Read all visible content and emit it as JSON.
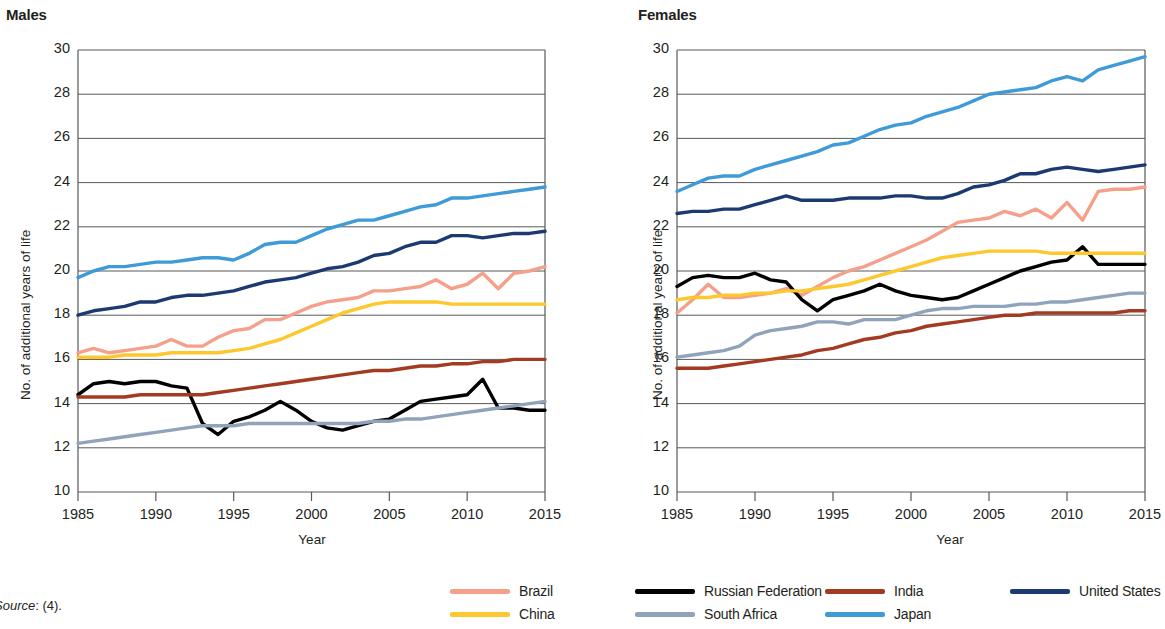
{
  "figure": {
    "source_note_italic": "Source",
    "source_note_rest": ": (4)."
  },
  "legend": {
    "position": "bottom-center",
    "items": [
      {
        "label": "Brazil",
        "color": "#f4a08a"
      },
      {
        "label": "Russian Federation",
        "color": "#000000"
      },
      {
        "label": "India",
        "color": "#a33b22"
      },
      {
        "label": "United States",
        "color": "#1c3a71"
      },
      {
        "label": "China",
        "color": "#fcc82d"
      },
      {
        "label": "South Africa",
        "color": "#8fa4bb"
      },
      {
        "label": "Japan",
        "color": "#3f9ad8"
      }
    ]
  },
  "chart_data": [
    {
      "type": "line",
      "title": "Males",
      "xlabel": "Year",
      "ylabel": "No. of additional years of life",
      "xlim": [
        1985,
        2015
      ],
      "ylim": [
        10,
        30
      ],
      "xticks": [
        1985,
        1990,
        1995,
        2000,
        2005,
        2010,
        2015
      ],
      "yticks": [
        10,
        12,
        14,
        16,
        18,
        20,
        22,
        24,
        26,
        28,
        30
      ],
      "grid": true,
      "x": [
        1985,
        1986,
        1987,
        1988,
        1989,
        1990,
        1991,
        1992,
        1993,
        1994,
        1995,
        1996,
        1997,
        1998,
        1999,
        2000,
        2001,
        2002,
        2003,
        2004,
        2005,
        2006,
        2007,
        2008,
        2009,
        2010,
        2011,
        2012,
        2013,
        2014,
        2015
      ],
      "series": [
        {
          "name": "Brazil",
          "color": "#f4a08a",
          "values": [
            16.3,
            16.5,
            16.3,
            16.4,
            16.5,
            16.6,
            16.9,
            16.6,
            16.6,
            17.0,
            17.3,
            17.4,
            17.8,
            17.8,
            18.1,
            18.4,
            18.6,
            18.7,
            18.8,
            19.1,
            19.1,
            19.2,
            19.3,
            19.6,
            19.2,
            19.4,
            19.9,
            19.2,
            19.9,
            20.0,
            20.2
          ]
        },
        {
          "name": "Russian Federation",
          "color": "#000000",
          "values": [
            14.4,
            14.9,
            15.0,
            14.9,
            15.0,
            15.0,
            14.8,
            14.7,
            13.1,
            12.6,
            13.2,
            13.4,
            13.7,
            14.1,
            13.7,
            13.2,
            12.9,
            12.8,
            13.0,
            13.2,
            13.3,
            13.7,
            14.1,
            14.2,
            14.3,
            14.4,
            15.1,
            13.8,
            13.8,
            13.7,
            13.7
          ]
        },
        {
          "name": "India",
          "color": "#a33b22",
          "values": [
            14.3,
            14.3,
            14.3,
            14.3,
            14.4,
            14.4,
            14.4,
            14.4,
            14.4,
            14.5,
            14.6,
            14.7,
            14.8,
            14.9,
            15.0,
            15.1,
            15.2,
            15.3,
            15.4,
            15.5,
            15.5,
            15.6,
            15.7,
            15.7,
            15.8,
            15.8,
            15.9,
            15.9,
            16.0,
            16.0,
            16.0
          ]
        },
        {
          "name": "United States",
          "color": "#1c3a71",
          "values": [
            18.0,
            18.2,
            18.3,
            18.4,
            18.6,
            18.6,
            18.8,
            18.9,
            18.9,
            19.0,
            19.1,
            19.3,
            19.5,
            19.6,
            19.7,
            19.9,
            20.1,
            20.2,
            20.4,
            20.7,
            20.8,
            21.1,
            21.3,
            21.3,
            21.6,
            21.6,
            21.5,
            21.6,
            21.7,
            21.7,
            21.8
          ]
        },
        {
          "name": "China",
          "color": "#fcc82d",
          "values": [
            16.1,
            16.1,
            16.1,
            16.2,
            16.2,
            16.2,
            16.3,
            16.3,
            16.3,
            16.3,
            16.4,
            16.5,
            16.7,
            16.9,
            17.2,
            17.5,
            17.8,
            18.1,
            18.3,
            18.5,
            18.6,
            18.6,
            18.6,
            18.6,
            18.5,
            18.5,
            18.5,
            18.5,
            18.5,
            18.5,
            18.5
          ]
        },
        {
          "name": "South Africa",
          "color": "#8fa4bb",
          "values": [
            12.2,
            12.3,
            12.4,
            12.5,
            12.6,
            12.7,
            12.8,
            12.9,
            13.0,
            13.0,
            13.0,
            13.1,
            13.1,
            13.1,
            13.1,
            13.1,
            13.1,
            13.1,
            13.1,
            13.2,
            13.2,
            13.3,
            13.3,
            13.4,
            13.5,
            13.6,
            13.7,
            13.8,
            13.9,
            14.0,
            14.1
          ]
        },
        {
          "name": "Japan",
          "color": "#3f9ad8",
          "values": [
            19.7,
            20.0,
            20.2,
            20.2,
            20.3,
            20.4,
            20.4,
            20.5,
            20.6,
            20.6,
            20.5,
            20.8,
            21.2,
            21.3,
            21.3,
            21.6,
            21.9,
            22.1,
            22.3,
            22.3,
            22.5,
            22.7,
            22.9,
            23.0,
            23.3,
            23.3,
            23.4,
            23.5,
            23.6,
            23.7,
            23.8
          ]
        }
      ]
    },
    {
      "type": "line",
      "title": "Females",
      "xlabel": "Year",
      "ylabel": "No. of additional years of life",
      "xlim": [
        1985,
        2015
      ],
      "ylim": [
        10,
        30
      ],
      "xticks": [
        1985,
        1990,
        1995,
        2000,
        2005,
        2010,
        2015
      ],
      "yticks": [
        10,
        12,
        14,
        16,
        18,
        20,
        22,
        24,
        26,
        28,
        30
      ],
      "grid": true,
      "x": [
        1985,
        1986,
        1987,
        1988,
        1989,
        1990,
        1991,
        1992,
        1993,
        1994,
        1995,
        1996,
        1997,
        1998,
        1999,
        2000,
        2001,
        2002,
        2003,
        2004,
        2005,
        2006,
        2007,
        2008,
        2009,
        2010,
        2011,
        2012,
        2013,
        2014,
        2015
      ],
      "series": [
        {
          "name": "Brazil",
          "color": "#f4a08a",
          "values": [
            18.1,
            18.7,
            19.4,
            18.8,
            18.8,
            18.9,
            19.0,
            19.2,
            18.9,
            19.3,
            19.7,
            20.0,
            20.2,
            20.5,
            20.8,
            21.1,
            21.4,
            21.8,
            22.2,
            22.3,
            22.4,
            22.7,
            22.5,
            22.8,
            22.4,
            23.1,
            22.3,
            23.6,
            23.7,
            23.7,
            23.8
          ]
        },
        {
          "name": "Russian Federation",
          "color": "#000000",
          "values": [
            19.3,
            19.7,
            19.8,
            19.7,
            19.7,
            19.9,
            19.6,
            19.5,
            18.7,
            18.2,
            18.7,
            18.9,
            19.1,
            19.4,
            19.1,
            18.9,
            18.8,
            18.7,
            18.8,
            19.1,
            19.4,
            19.7,
            20.0,
            20.2,
            20.4,
            20.5,
            21.1,
            20.3,
            20.3,
            20.3,
            20.3
          ]
        },
        {
          "name": "India",
          "color": "#a33b22",
          "values": [
            15.6,
            15.6,
            15.6,
            15.7,
            15.8,
            15.9,
            16.0,
            16.1,
            16.2,
            16.4,
            16.5,
            16.7,
            16.9,
            17.0,
            17.2,
            17.3,
            17.5,
            17.6,
            17.7,
            17.8,
            17.9,
            18.0,
            18.0,
            18.1,
            18.1,
            18.1,
            18.1,
            18.1,
            18.1,
            18.2,
            18.2
          ]
        },
        {
          "name": "United States",
          "color": "#1c3a71",
          "values": [
            22.6,
            22.7,
            22.7,
            22.8,
            22.8,
            23.0,
            23.2,
            23.4,
            23.2,
            23.2,
            23.2,
            23.3,
            23.3,
            23.3,
            23.4,
            23.4,
            23.3,
            23.3,
            23.5,
            23.8,
            23.9,
            24.1,
            24.4,
            24.4,
            24.6,
            24.7,
            24.6,
            24.5,
            24.6,
            24.7,
            24.8
          ]
        },
        {
          "name": "China",
          "color": "#fcc82d",
          "values": [
            18.7,
            18.8,
            18.8,
            18.9,
            18.9,
            19.0,
            19.0,
            19.1,
            19.1,
            19.2,
            19.3,
            19.4,
            19.6,
            19.8,
            20.0,
            20.2,
            20.4,
            20.6,
            20.7,
            20.8,
            20.9,
            20.9,
            20.9,
            20.9,
            20.8,
            20.8,
            20.8,
            20.8,
            20.8,
            20.8,
            20.8
          ]
        },
        {
          "name": "South Africa",
          "color": "#8fa4bb",
          "values": [
            16.1,
            16.2,
            16.3,
            16.4,
            16.6,
            17.1,
            17.3,
            17.4,
            17.5,
            17.7,
            17.7,
            17.6,
            17.8,
            17.8,
            17.8,
            18.0,
            18.2,
            18.3,
            18.3,
            18.4,
            18.4,
            18.4,
            18.5,
            18.5,
            18.6,
            18.6,
            18.7,
            18.8,
            18.9,
            19.0,
            19.0
          ]
        },
        {
          "name": "Japan",
          "color": "#3f9ad8",
          "values": [
            23.6,
            23.9,
            24.2,
            24.3,
            24.3,
            24.6,
            24.8,
            25.0,
            25.2,
            25.4,
            25.7,
            25.8,
            26.1,
            26.4,
            26.6,
            26.7,
            27.0,
            27.2,
            27.4,
            27.7,
            28.0,
            28.1,
            28.2,
            28.3,
            28.6,
            28.8,
            28.6,
            29.1,
            29.3,
            29.5,
            29.7
          ]
        }
      ]
    }
  ]
}
